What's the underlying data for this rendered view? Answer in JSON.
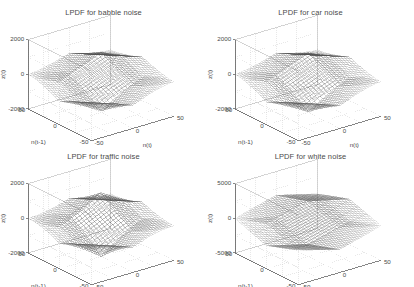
{
  "figure": {
    "background_color": "#ffffff",
    "layout": "2x2 grid of 3D mesh surface plots",
    "axis_color": "#555555",
    "grid_color": "#cfcfcf",
    "mesh_color": "#4d4d4d"
  },
  "chart_data": [
    {
      "type": "surface",
      "panel": 0,
      "title": "LPDF for babble noise",
      "xlabel": "n(t)",
      "ylabel": "n(t-1)",
      "zlabel": "z(t)",
      "xticks": [
        -50,
        0,
        50
      ],
      "xticklabels": [
        "-50",
        "0",
        "50"
      ],
      "yticks": [
        -50,
        0,
        50
      ],
      "yticklabels": [
        "-50",
        "0",
        "50"
      ],
      "zticks": [
        -2000,
        0,
        2000
      ],
      "zticklabels": [
        "-2000",
        "0",
        "2000"
      ],
      "xlim": [
        -50,
        50
      ],
      "ylim": [
        -50,
        50
      ],
      "zlim": [
        -2000,
        2000
      ],
      "grid": true,
      "legend": null,
      "peak_value": 1500,
      "trough_value": -1900,
      "shape": "double cone: sharp upper pyramid peak and wider inverted lower pyramid",
      "sharpness": 1.55,
      "mesh_density": 28
    },
    {
      "type": "surface",
      "panel": 1,
      "title": "LPDF for car noise",
      "xlabel": "n(t)",
      "ylabel": "n(t-1)",
      "zlabel": "z(t)",
      "xticks": [
        -50,
        0,
        50
      ],
      "xticklabels": [
        "-50",
        "0",
        "50"
      ],
      "yticks": [
        -50,
        0,
        50
      ],
      "yticklabels": [
        "-50",
        "0",
        "50"
      ],
      "zticks": [
        -2000,
        0,
        2000
      ],
      "zticklabels": [
        "-2000",
        "0",
        "2000"
      ],
      "xlim": [
        -50,
        50
      ],
      "ylim": [
        -50,
        50
      ],
      "zlim": [
        -2000,
        2000
      ],
      "grid": true,
      "legend": null,
      "peak_value": 1450,
      "trough_value": -1950,
      "shape": "double cone: sharp upper pyramid peak and wider inverted lower pyramid",
      "sharpness": 1.5,
      "mesh_density": 28
    },
    {
      "type": "surface",
      "panel": 2,
      "title": "LPDF for traffic noise",
      "xlabel": "n(t)",
      "ylabel": "n(t-1)",
      "zlabel": "z(t)",
      "xticks": [
        -50,
        0,
        50
      ],
      "xticklabels": [
        "-50",
        "0",
        "50"
      ],
      "yticks": [
        -50,
        0,
        50
      ],
      "yticklabels": [
        "-50",
        "0",
        "50"
      ],
      "zticks": [
        -2000,
        0,
        2000
      ],
      "zticklabels": [
        "-2000",
        "0",
        "2000"
      ],
      "xlim": [
        -50,
        50
      ],
      "ylim": [
        -50,
        50
      ],
      "zlim": [
        -2000,
        2000
      ],
      "grid": true,
      "legend": null,
      "peak_value": 1700,
      "trough_value": -2000,
      "shape": "double cone with sharpest, most pointed peak and deep inverted lower cone",
      "sharpness": 1.9,
      "mesh_density": 28
    },
    {
      "type": "surface",
      "panel": 3,
      "title": "LPDF for white noise",
      "xlabel": "n(t)",
      "ylabel": "n(t-1)",
      "zlabel": "z(t)",
      "xticks": [
        -50,
        0,
        50
      ],
      "xticklabels": [
        "-50",
        "0",
        "50"
      ],
      "yticks": [
        -50,
        0,
        50
      ],
      "yticklabels": [
        "-50",
        "0",
        "50"
      ],
      "zticks": [
        -5000,
        0,
        5000
      ],
      "zticklabels": [
        "-5000",
        "0",
        "5000"
      ],
      "xlim": [
        -50,
        50
      ],
      "ylim": [
        -50,
        50
      ],
      "zlim": [
        -5000,
        5000
      ],
      "grid": true,
      "legend": null,
      "peak_value": 3000,
      "trough_value": -3200,
      "shape": "broad flat saddle-like surface, wide shallow double cone",
      "sharpness": 0.95,
      "mesh_density": 30
    }
  ]
}
